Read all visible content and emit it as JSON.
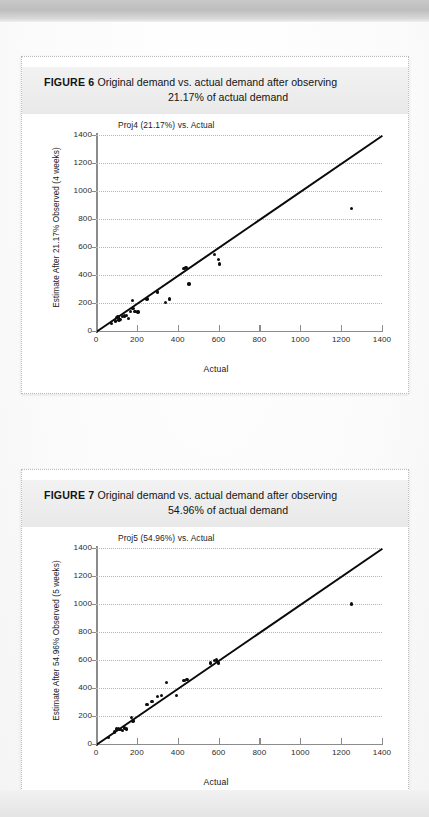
{
  "page": {
    "background_color": "#f7f7f7",
    "card_background": "#ffffff"
  },
  "figures": [
    {
      "id": "figure-6",
      "label": "FIGURE 6",
      "caption_line1": "Original demand vs. actual demand after observing",
      "caption_line2": "21.17% of actual demand",
      "chart_data": {
        "type": "scatter",
        "title": "Proj4 (21.17%) vs. Actual",
        "xlabel": "Actual",
        "ylabel": "Estimate After 21.17% Observed (4 weeks)",
        "xlim": [
          0,
          1400
        ],
        "ylim": [
          0,
          1400
        ],
        "xticks": [
          0,
          200,
          400,
          600,
          800,
          1000,
          1200,
          1400
        ],
        "yticks": [
          0,
          200,
          400,
          600,
          800,
          1000,
          1200,
          1400
        ],
        "grid": "horizontal-dotted",
        "legend": "none",
        "reference_line": {
          "label": "y = x",
          "from": [
            0,
            0
          ],
          "to": [
            1400,
            1400
          ],
          "color": "#0a0a0a"
        },
        "points": [
          [
            75,
            55
          ],
          [
            95,
            72
          ],
          [
            100,
            95
          ],
          [
            108,
            100
          ],
          [
            112,
            78
          ],
          [
            118,
            82
          ],
          [
            130,
            105
          ],
          [
            140,
            108
          ],
          [
            150,
            110
          ],
          [
            158,
            88
          ],
          [
            170,
            138
          ],
          [
            178,
            218
          ],
          [
            182,
            160
          ],
          [
            190,
            138
          ],
          [
            205,
            135
          ],
          [
            250,
            230
          ],
          [
            300,
            280
          ],
          [
            340,
            205
          ],
          [
            360,
            228
          ],
          [
            430,
            445
          ],
          [
            440,
            455
          ],
          [
            455,
            335
          ],
          [
            580,
            545
          ],
          [
            600,
            510
          ],
          [
            605,
            480
          ],
          [
            1250,
            875
          ]
        ]
      }
    },
    {
      "id": "figure-7",
      "label": "FIGURE 7",
      "caption_line1": "Original demand vs. actual demand after observing",
      "caption_line2": "54.96% of actual demand",
      "chart_data": {
        "type": "scatter",
        "title": "Proj5 (54.96%) vs. Actual",
        "xlabel": "Actual",
        "ylabel": "Estimate After 54.96% Observed (5 weeks)",
        "xlim": [
          0,
          1400
        ],
        "ylim": [
          0,
          1400
        ],
        "xticks": [
          0,
          200,
          400,
          600,
          800,
          1000,
          1200,
          1400
        ],
        "yticks": [
          0,
          200,
          400,
          600,
          800,
          1000,
          1200,
          1400
        ],
        "grid": "horizontal-dotted",
        "legend": "none",
        "reference_line": {
          "label": "y = x",
          "from": [
            0,
            0
          ],
          "to": [
            1400,
            1400
          ],
          "color": "#0a0a0a"
        },
        "points": [
          [
            60,
            48
          ],
          [
            90,
            85
          ],
          [
            100,
            108
          ],
          [
            110,
            112
          ],
          [
            118,
            105
          ],
          [
            130,
            98
          ],
          [
            140,
            115
          ],
          [
            150,
            108
          ],
          [
            175,
            190
          ],
          [
            182,
            165
          ],
          [
            250,
            282
          ],
          [
            275,
            305
          ],
          [
            300,
            340
          ],
          [
            320,
            345
          ],
          [
            345,
            438
          ],
          [
            395,
            345
          ],
          [
            430,
            455
          ],
          [
            445,
            462
          ],
          [
            560,
            580
          ],
          [
            580,
            598
          ],
          [
            590,
            600
          ],
          [
            600,
            578
          ],
          [
            1250,
            1000
          ]
        ]
      }
    }
  ]
}
